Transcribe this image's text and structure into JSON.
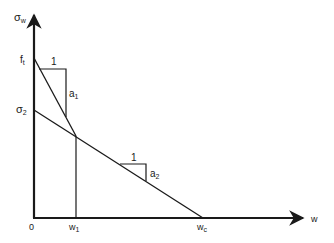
{
  "diagram": {
    "type": "bilinear softening diagram",
    "colors": {
      "line": "#1a1a1a",
      "background": "#ffffff"
    },
    "axes": {
      "y_label": {
        "main": "σ",
        "sub": "w"
      },
      "x_label": "w",
      "origin_label": "0"
    },
    "y_ticks": [
      {
        "main": "f",
        "sub": "t"
      },
      {
        "main": "σ",
        "sub": "2"
      }
    ],
    "x_ticks": [
      {
        "main": "w",
        "sub": "1"
      },
      {
        "main": "w",
        "sub": "c"
      }
    ],
    "slope_triangles": [
      {
        "run_label": "1",
        "rise_label": {
          "main": "a",
          "sub": "1"
        }
      },
      {
        "run_label": "1",
        "rise_label": {
          "main": "a",
          "sub": "2"
        }
      }
    ]
  }
}
